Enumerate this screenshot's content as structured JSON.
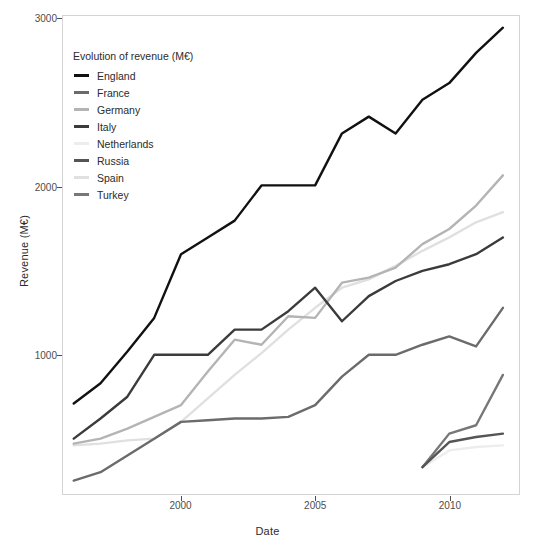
{
  "chart_data": {
    "type": "line",
    "title": "",
    "xlabel": "Date",
    "ylabel": "Revenue (M€)",
    "legend_title": "Evolution of revenue (M€)",
    "legend_position": "top-left-inside",
    "grid": false,
    "xlim": [
      1995.6,
      2012.6
    ],
    "ylim": [
      170,
      3020
    ],
    "x_ticks": [
      2000,
      2005,
      2010
    ],
    "x_tick_labels": [
      "2000",
      "2005",
      "2010"
    ],
    "y_ticks": [
      1000,
      2000,
      3000
    ],
    "y_tick_labels": [
      "1000",
      "2000",
      "3000"
    ],
    "series": [
      {
        "name": "England",
        "color": "#111111",
        "x": [
          1996,
          1997,
          1998,
          1999,
          2000,
          2001,
          2002,
          2003,
          2004,
          2005,
          2006,
          2007,
          2008,
          2009,
          2010,
          2011,
          2012
        ],
        "values": [
          710,
          830,
          1020,
          1220,
          1600,
          1700,
          1800,
          2010,
          2010,
          2010,
          2320,
          2420,
          2320,
          2520,
          2620,
          2800,
          2950
        ]
      },
      {
        "name": "France",
        "color": "#6b6b6b",
        "x": [
          1996,
          1997,
          1998,
          1999,
          2000,
          2001,
          2002,
          2003,
          2004,
          2005,
          2006,
          2007,
          2008,
          2009,
          2010,
          2011,
          2012
        ],
        "values": [
          250,
          300,
          400,
          500,
          600,
          610,
          620,
          620,
          630,
          700,
          870,
          1000,
          1000,
          1060,
          1110,
          1050,
          1280
        ]
      },
      {
        "name": "Germany",
        "color": "#b4b4b4",
        "x": [
          1996,
          1997,
          1998,
          1999,
          2000,
          2001,
          2002,
          2003,
          2004,
          2005,
          2006,
          2007,
          2008,
          2009,
          2010,
          2011,
          2012
        ],
        "values": [
          470,
          500,
          560,
          630,
          700,
          900,
          1090,
          1060,
          1230,
          1220,
          1430,
          1460,
          1520,
          1660,
          1750,
          1890,
          2070
        ]
      },
      {
        "name": "Italy",
        "color": "#3b3b3b",
        "x": [
          1996,
          1997,
          1998,
          1999,
          2000,
          2001,
          2002,
          2003,
          2004,
          2005,
          2006,
          2007,
          2008,
          2009,
          2010,
          2011,
          2012
        ],
        "values": [
          500,
          620,
          750,
          1000,
          1000,
          1000,
          1150,
          1150,
          1260,
          1400,
          1200,
          1350,
          1440,
          1500,
          1540,
          1600,
          1700
        ]
      },
      {
        "name": "Netherlands",
        "color": "#ededed",
        "x": [
          2009,
          2010,
          2011,
          2012
        ],
        "values": [
          330,
          430,
          450,
          460
        ]
      },
      {
        "name": "Russia",
        "color": "#555555",
        "x": [
          2009,
          2010,
          2011,
          2012
        ],
        "values": [
          330,
          480,
          510,
          530
        ]
      },
      {
        "name": "Spain",
        "color": "#e0e0e0",
        "x": [
          1996,
          1997,
          1998,
          1999,
          2000,
          2001,
          2002,
          2003,
          2004,
          2005,
          2006,
          2007,
          2008,
          2009,
          2010,
          2011,
          2012
        ],
        "values": [
          460,
          470,
          490,
          500,
          600,
          740,
          880,
          1010,
          1150,
          1280,
          1400,
          1450,
          1530,
          1620,
          1700,
          1790,
          1850
        ]
      },
      {
        "name": "Turkey",
        "color": "#777777",
        "x": [
          2009,
          2010,
          2011,
          2012
        ],
        "values": [
          330,
          530,
          580,
          880
        ]
      }
    ]
  },
  "legend": {
    "title": "Evolution of revenue (M€)",
    "items": [
      {
        "label": "England",
        "color": "#111111"
      },
      {
        "label": "France",
        "color": "#6b6b6b"
      },
      {
        "label": "Germany",
        "color": "#b4b4b4"
      },
      {
        "label": "Italy",
        "color": "#3b3b3b"
      },
      {
        "label": "Netherlands",
        "color": "#ededed"
      },
      {
        "label": "Russia",
        "color": "#555555"
      },
      {
        "label": "Spain",
        "color": "#e0e0e0"
      },
      {
        "label": "Turkey",
        "color": "#777777"
      }
    ]
  },
  "axes": {
    "x_title": "Date",
    "y_title": "Revenue (M€)",
    "x_tick_labels": [
      "2000",
      "2005",
      "2010"
    ],
    "y_tick_labels": [
      "1000",
      "2000",
      "3000"
    ]
  },
  "theme": {
    "panel_background": "#ffffff",
    "panel_border": "#d4d4d4",
    "text_color": "#2b2b2b",
    "tick_color": "#4d4d4d"
  }
}
